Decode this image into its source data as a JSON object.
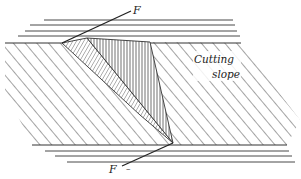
{
  "diagram": {
    "type": "geological fault cross-section",
    "labels": {
      "fault_top": "F",
      "fault_bottom": "F",
      "bottom_mark": "–",
      "cutting_slope_line1": "Cutting",
      "cutting_slope_line2": "slope"
    },
    "colors": {
      "ink": "#222222",
      "background": "#ffffff"
    }
  }
}
